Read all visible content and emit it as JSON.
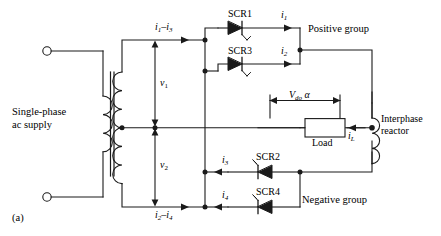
{
  "figure": {
    "caption": "(a)",
    "type": "circuit-diagram"
  },
  "colors": {
    "wire": "#1a1a1a",
    "text": "#000000",
    "background": "#ffffff"
  },
  "source": {
    "label_line1": "Single-phase",
    "label_line2": "ac supply",
    "terminal_top": "ac-terminal-top",
    "terminal_bottom": "ac-terminal-bottom"
  },
  "transformer": {
    "primary_name": "primary-winding",
    "secondary_name": "secondary-winding",
    "core_name": "transformer-core",
    "centre_tap": "centre-tap"
  },
  "voltages": {
    "v1": "v",
    "v1_sub": "1",
    "v2": "v",
    "v2_sub": "2"
  },
  "currents": {
    "top_line": "i",
    "top_line_sub1": "1",
    "top_line_dash": "–",
    "top_line_i2": "i",
    "top_line_sub2": "3",
    "bottom_line": "i",
    "bottom_line_sub1": "2",
    "bottom_line_dash": "–",
    "bottom_line_i2": "i",
    "bottom_line_sub2": "4",
    "i1": "i",
    "i1_sub": "1",
    "i2": "i",
    "i2_sub": "2",
    "i3": "i",
    "i3_sub": "3",
    "i4": "i",
    "i4_sub": "4",
    "iL": "i",
    "iL_sub": "L"
  },
  "thyristors": [
    {
      "id": "SCR1",
      "label": "SCR1",
      "group": "positive"
    },
    {
      "id": "SCR3",
      "label": "SCR3",
      "group": "positive"
    },
    {
      "id": "SCR2",
      "label": "SCR2",
      "group": "negative"
    },
    {
      "id": "SCR4",
      "label": "SCR4",
      "group": "negative"
    }
  ],
  "groups": {
    "positive": "Positive group",
    "negative": "Negative group"
  },
  "load": {
    "label": "Load",
    "voltage_symbol": "V",
    "voltage_sub": "do",
    "voltage_alpha": "α"
  },
  "reactor": {
    "line1": "Interphase",
    "line2": "reactor"
  }
}
